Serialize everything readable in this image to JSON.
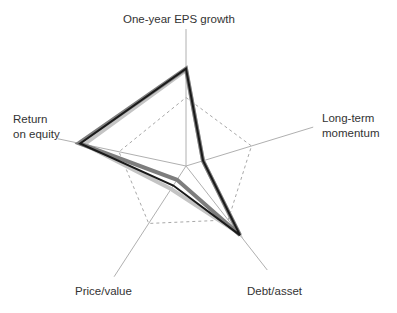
{
  "chart_data": {
    "type": "radar",
    "title": "",
    "axes": [
      "One-year EPS growth",
      "Long-term momentum",
      "Debt/asset",
      "Price/value",
      "Return on equity"
    ],
    "axis_labels": {
      "eps": "One-year EPS growth",
      "momentum_line1": "Long-term",
      "momentum_line2": "momentum",
      "debt": "Debt/asset",
      "price": "Price/value",
      "roe_line1": "Return",
      "roe_line2": "on equity"
    },
    "range": [
      0,
      1
    ],
    "reference_level": 0.5,
    "reference_style": "dashed",
    "series": [
      {
        "name": "Series A (light gray fill)",
        "color": "#c4c4c4",
        "values": [
          0.7,
          0.13,
          0.62,
          0.2,
          0.76
        ]
      },
      {
        "name": "Series B (dark gray fill)",
        "color": "#7d7d7d",
        "values": [
          0.71,
          0.13,
          0.64,
          0.12,
          0.8
        ]
      },
      {
        "name": "Series C (black line)",
        "color": "#1a1a1a",
        "values": [
          0.71,
          0.13,
          0.64,
          0.17,
          0.79
        ]
      }
    ],
    "grid": false,
    "legend": "none"
  }
}
